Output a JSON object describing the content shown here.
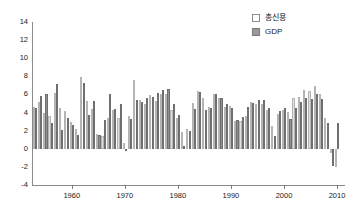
{
  "chart_data": {
    "type": "bar",
    "title": "",
    "subtitle": "",
    "xlabel": "",
    "ylabel": "",
    "ylim": [
      -4,
      14
    ],
    "yticks": [
      -4,
      -2,
      0,
      2,
      4,
      6,
      8,
      10,
      12,
      14
    ],
    "xticks": [
      1960,
      1970,
      1980,
      1990,
      2000,
      2010
    ],
    "xlim": [
      1952.5,
      2011.5
    ],
    "grid": false,
    "legend_position": "top-right",
    "colors": {
      "credit": "#e2e2e2",
      "gdp": "#8f8f8f",
      "axis": "#8a8a8a",
      "text": "#1a1a1a"
    },
    "x": [
      1953,
      1954,
      1955,
      1956,
      1957,
      1958,
      1959,
      1960,
      1961,
      1962,
      1963,
      1964,
      1965,
      1966,
      1967,
      1968,
      1969,
      1970,
      1971,
      1972,
      1973,
      1974,
      1975,
      1976,
      1977,
      1978,
      1979,
      1980,
      1981,
      1982,
      1983,
      1984,
      1985,
      1986,
      1987,
      1988,
      1989,
      1990,
      1991,
      1992,
      1993,
      1994,
      1995,
      1996,
      1997,
      1998,
      1999,
      2000,
      2001,
      2002,
      2003,
      2004,
      2005,
      2006,
      2007,
      2008,
      2009,
      2010
    ],
    "series": [
      {
        "name": "총신용",
        "values": [
          4.6,
          5.2,
          4.0,
          3.6,
          6.2,
          4.5,
          4.2,
          3.0,
          2.2,
          7.9,
          5.3,
          4.4,
          1.6,
          1.4,
          3.4,
          4.3,
          3.4,
          0.6,
          3.6,
          7.6,
          5.4,
          4.9,
          5.9,
          5.3,
          6.1,
          6.0,
          4.3,
          3.4,
          1.8,
          2.2,
          5.1,
          6.4,
          5.6,
          4.6,
          6.1,
          5.6,
          4.6,
          4.7,
          3.1,
          3.1,
          3.6,
          5.2,
          5.0,
          4.9,
          4.3,
          2.5,
          3.8,
          4.3,
          4.1,
          5.6,
          5.7,
          6.5,
          6.4,
          6.9,
          6.1,
          3.4,
          -0.5,
          -2.0
        ]
      },
      {
        "name": "GDP",
        "values": [
          4.5,
          5.8,
          6.0,
          2.8,
          7.1,
          2.1,
          3.4,
          2.6,
          1.5,
          7.3,
          3.7,
          5.3,
          1.5,
          3.2,
          6.1,
          4.4,
          5.0,
          -0.2,
          3.3,
          5.4,
          5.2,
          5.6,
          5.7,
          6.2,
          6.5,
          6.6,
          5.0,
          3.7,
          0.3,
          2.0,
          4.4,
          6.3,
          4.3,
          4.5,
          6.0,
          5.6,
          5.0,
          4.5,
          3.2,
          3.5,
          4.6,
          5.1,
          5.4,
          5.4,
          4.5,
          1.4,
          4.2,
          4.5,
          3.3,
          4.5,
          5.2,
          5.6,
          5.5,
          6.0,
          5.5,
          2.9,
          -1.9,
          2.9
        ]
      }
    ]
  },
  "legend": {
    "items": [
      {
        "label": "총신용",
        "key": "credit"
      },
      {
        "label": "GDP",
        "key": "gdp"
      }
    ]
  }
}
